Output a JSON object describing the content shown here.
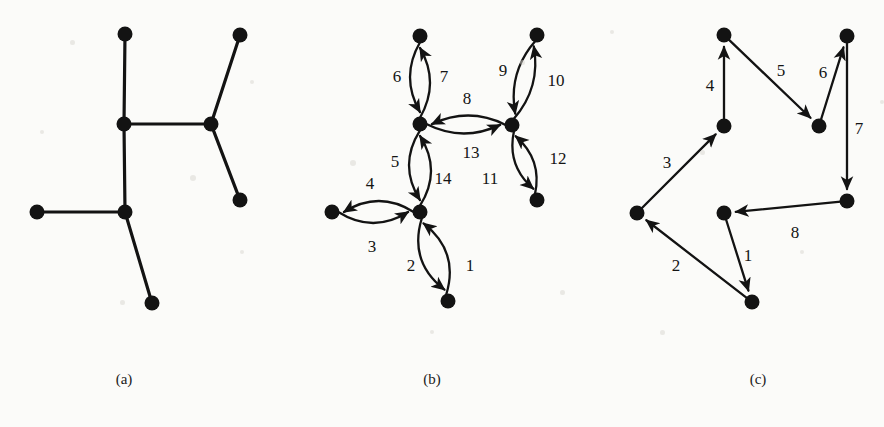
{
  "figure": {
    "width": 884,
    "height": 427,
    "background_color": "#fbfbf9",
    "ink_color": "#131313",
    "node_radius": 7.5,
    "stroke_width": 3.2
  },
  "captions": [
    {
      "id": "caption-a",
      "text": "(a)",
      "x": 124,
      "y": 379
    },
    {
      "id": "caption-b",
      "text": "(b)",
      "x": 432,
      "y": 379
    },
    {
      "id": "caption-c",
      "text": "(c)",
      "x": 758,
      "y": 379
    }
  ],
  "panels": [
    {
      "id": "panel-a",
      "caption": "(a)",
      "kind": "undirected-tree",
      "nodes": [
        {
          "id": "a1",
          "x": 125,
          "y": 34
        },
        {
          "id": "a2",
          "x": 240,
          "y": 35
        },
        {
          "id": "a3",
          "x": 124,
          "y": 124
        },
        {
          "id": "a4",
          "x": 211,
          "y": 124
        },
        {
          "id": "a5",
          "x": 240,
          "y": 200
        },
        {
          "id": "a6",
          "x": 37,
          "y": 212
        },
        {
          "id": "a7",
          "x": 125,
          "y": 212
        },
        {
          "id": "a8",
          "x": 152,
          "y": 303
        }
      ],
      "edges": [
        {
          "from": "a1",
          "to": "a3",
          "label": ""
        },
        {
          "from": "a3",
          "to": "a4",
          "label": ""
        },
        {
          "from": "a4",
          "to": "a2",
          "label": ""
        },
        {
          "from": "a4",
          "to": "a5",
          "label": ""
        },
        {
          "from": "a3",
          "to": "a7",
          "label": ""
        },
        {
          "from": "a6",
          "to": "a7",
          "label": ""
        },
        {
          "from": "a7",
          "to": "a8",
          "label": ""
        }
      ]
    },
    {
      "id": "panel-b",
      "caption": "(b)",
      "kind": "directed-traversal",
      "nodes": [
        {
          "id": "b_top",
          "x": 420,
          "y": 36
        },
        {
          "id": "b_mid",
          "x": 420,
          "y": 124
        },
        {
          "id": "b_right_top",
          "x": 537,
          "y": 35
        },
        {
          "id": "b_right_mid",
          "x": 512,
          "y": 125
        },
        {
          "id": "b_right_bot",
          "x": 537,
          "y": 200
        },
        {
          "id": "b_left",
          "x": 332,
          "y": 212
        },
        {
          "id": "b_hub",
          "x": 420,
          "y": 212
        },
        {
          "id": "b_bot",
          "x": 448,
          "y": 301
        }
      ],
      "edges": [
        {
          "step": 1,
          "from": "b_hub",
          "to": "b_bot",
          "label": "1",
          "label_x": 470,
          "label_y": 265,
          "bow": 26
        },
        {
          "step": 2,
          "from": "b_bot",
          "to": "b_hub",
          "label": "2",
          "label_x": 411,
          "label_y": 265,
          "bow": 26
        },
        {
          "step": 3,
          "from": "b_hub",
          "to": "b_left",
          "label": "3",
          "label_x": 372,
          "label_y": 246,
          "bow": 22
        },
        {
          "step": 4,
          "from": "b_left",
          "to": "b_hub",
          "label": "4",
          "label_x": 370,
          "label_y": 183,
          "bow": 22
        },
        {
          "step": 5,
          "from": "b_hub",
          "to": "b_mid",
          "label": "5",
          "label_x": 395,
          "label_y": 161,
          "bow": 22
        },
        {
          "step": 6,
          "from": "b_mid",
          "to": "b_top",
          "label": "6",
          "label_x": 397,
          "label_y": 76,
          "bow": 20
        },
        {
          "step": 7,
          "from": "b_top",
          "to": "b_mid",
          "label": "7",
          "label_x": 444,
          "label_y": 76,
          "bow": 20
        },
        {
          "step": 8,
          "from": "b_mid",
          "to": "b_right_mid",
          "label": "8",
          "label_x": 467,
          "label_y": 98,
          "bow": 18
        },
        {
          "step": 9,
          "from": "b_right_mid",
          "to": "b_right_top",
          "label": "9",
          "label_x": 503,
          "label_y": 70,
          "bow": 18
        },
        {
          "step": 10,
          "from": "b_right_top",
          "to": "b_right_mid",
          "label": "10",
          "label_x": 556,
          "label_y": 80,
          "bow": 18
        },
        {
          "step": 11,
          "from": "b_right_mid",
          "to": "b_right_bot",
          "label": "11",
          "label_x": 490,
          "label_y": 178,
          "bow": 18
        },
        {
          "step": 12,
          "from": "b_right_bot",
          "to": "b_right_mid",
          "label": "12",
          "label_x": 558,
          "label_y": 158,
          "bow": 18
        },
        {
          "step": 13,
          "from": "b_right_mid",
          "to": "b_mid",
          "label": "13",
          "label_x": 471,
          "label_y": 152,
          "bow": 18
        },
        {
          "step": 14,
          "from": "b_mid",
          "to": "b_hub",
          "label": "14",
          "label_x": 443,
          "label_y": 178,
          "bow": 22
        }
      ]
    },
    {
      "id": "panel-c",
      "caption": "(c)",
      "kind": "directed-walk",
      "nodes": [
        {
          "id": "c_tl",
          "x": 724,
          "y": 35
        },
        {
          "id": "c_tr",
          "x": 847,
          "y": 36
        },
        {
          "id": "c_mid",
          "x": 724,
          "y": 126
        },
        {
          "id": "c_rmid",
          "x": 819,
          "y": 126
        },
        {
          "id": "c_right",
          "x": 847,
          "y": 201
        },
        {
          "id": "c_left",
          "x": 637,
          "y": 213
        },
        {
          "id": "c_ctr",
          "x": 724,
          "y": 213
        },
        {
          "id": "c_bot",
          "x": 752,
          "y": 302
        }
      ],
      "edges": [
        {
          "step": 1,
          "from": "c_ctr",
          "to": "c_bot",
          "label": "1",
          "label_x": 748,
          "label_y": 255
        },
        {
          "step": 2,
          "from": "c_bot",
          "to": "c_left",
          "label": "2",
          "label_x": 676,
          "label_y": 265
        },
        {
          "step": 3,
          "from": "c_left",
          "to": "c_mid",
          "label": "3",
          "label_x": 667,
          "label_y": 162
        },
        {
          "step": 4,
          "from": "c_mid",
          "to": "c_tl",
          "label": "4",
          "label_x": 710,
          "label_y": 85
        },
        {
          "step": 5,
          "from": "c_tl",
          "to": "c_rmid",
          "label": "5",
          "label_x": 781,
          "label_y": 70
        },
        {
          "step": 6,
          "from": "c_rmid",
          "to": "c_tr",
          "label": "6",
          "label_x": 823,
          "label_y": 72
        },
        {
          "step": 7,
          "from": "c_tr",
          "to": "c_right",
          "label": "7",
          "label_x": 859,
          "label_y": 128
        },
        {
          "step": 8,
          "from": "c_right",
          "to": "c_ctr",
          "label": "8",
          "label_x": 795,
          "label_y": 232
        }
      ]
    }
  ]
}
